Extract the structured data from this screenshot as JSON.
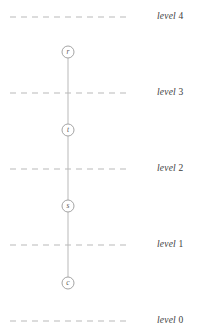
{
  "figure": {
    "kind": "level-graph-diagram",
    "background_color": "#ffffff",
    "line_color": "#b9b9b9",
    "node_stroke_color": "#9a9a9a",
    "node_fill_color": "#ffffff",
    "label_color": "#3d3d3d",
    "letter_color": "#5a5a5a",
    "width": 202,
    "height": 333
  },
  "levels": [
    {
      "id": "level-4",
      "word": "level",
      "number": "4",
      "y": 17,
      "label_x": 157,
      "x_start": 10,
      "x_end": 131
    },
    {
      "id": "level-3",
      "word": "level",
      "number": "3",
      "y": 93,
      "label_x": 157,
      "x_start": 10,
      "x_end": 131
    },
    {
      "id": "level-2",
      "word": "level",
      "number": "2",
      "y": 169,
      "label_x": 157,
      "x_start": 10,
      "x_end": 131
    },
    {
      "id": "level-1",
      "word": "level",
      "number": "1",
      "y": 245,
      "label_x": 157,
      "x_start": 10,
      "x_end": 131
    },
    {
      "id": "level-0",
      "word": "level",
      "number": "0",
      "y": 321,
      "label_x": 157,
      "x_start": 10,
      "x_end": 131
    }
  ],
  "nodes": [
    {
      "id": "node-r",
      "label": "r",
      "cx": 68,
      "cy": 52,
      "r": 6
    },
    {
      "id": "node-t",
      "label": "t",
      "cx": 68,
      "cy": 130,
      "r": 6
    },
    {
      "id": "node-s",
      "label": "s",
      "cx": 68,
      "cy": 206,
      "r": 6
    },
    {
      "id": "node-c",
      "label": "c",
      "cx": 68,
      "cy": 283,
      "r": 6
    }
  ],
  "edges": [
    {
      "id": "edge-r-t",
      "from": "r",
      "to": "t",
      "x1": 68,
      "y1": 58,
      "x2": 68,
      "y2": 124
    },
    {
      "id": "edge-t-s",
      "from": "t",
      "to": "s",
      "x1": 68,
      "y1": 136,
      "x2": 68,
      "y2": 200
    },
    {
      "id": "edge-s-c",
      "from": "s",
      "to": "c",
      "x1": 68,
      "y1": 212,
      "x2": 68,
      "y2": 277
    }
  ],
  "chart_data": {
    "type": "diagram",
    "title": "",
    "node_order_top_to_bottom": [
      "r",
      "t",
      "s",
      "c"
    ],
    "level_labels_top_to_bottom": [
      "level 4",
      "level 3",
      "level 2",
      "level 1",
      "level 0"
    ],
    "node_levels": {
      "r": "between level 4 and level 3",
      "t": "between level 3 and level 2",
      "s": "between level 2 and level 1",
      "c": "between level 1 and level 0"
    }
  }
}
